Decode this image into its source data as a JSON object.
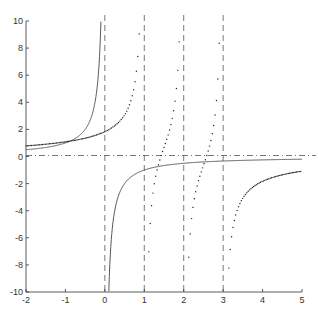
{
  "chart_data": {
    "type": "line",
    "title": "",
    "xlabel": "",
    "ylabel": "",
    "xlim": [
      -2,
      5
    ],
    "ylim": [
      -10,
      10
    ],
    "grid": false,
    "x_ticks": [
      "-2",
      "-1",
      "0",
      "1",
      "2",
      "3",
      "4",
      "5"
    ],
    "y_ticks": [
      "-10",
      "-8",
      "-6",
      "-4",
      "-2",
      "0",
      "2",
      "4",
      "6",
      "8",
      "10"
    ],
    "series": [
      {
        "name": "solid curve",
        "style": "solid",
        "formula": "y = -1/x",
        "asymptotes_x": [
          0
        ]
      },
      {
        "name": "dotted curve",
        "style": "dotted",
        "formula": "y = -1/(x-1) - 1/(x-2) - 1/(x-3)",
        "asymptotes_x": [
          1,
          2,
          3
        ]
      }
    ],
    "reference_lines": {
      "vertical_dashed_x": [
        0,
        1,
        2,
        3
      ],
      "horizontal_dashdot_y": [
        0
      ]
    }
  }
}
